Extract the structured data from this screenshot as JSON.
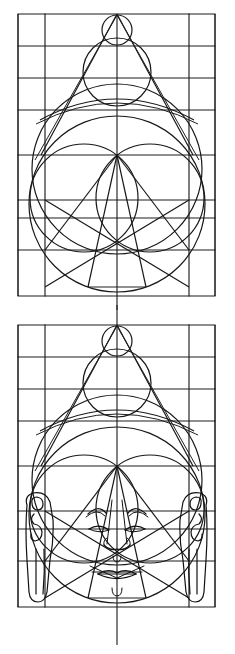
{
  "document": {
    "kind": "iconometric-construction-drawing",
    "subject": "Buddha head proportion grid",
    "figure_count": 2,
    "line_color": "#161616",
    "background_color": "#ffffff",
    "page_width": 235,
    "page_height": 654
  },
  "figures": [
    {
      "id": "figure-top",
      "label": "Geometric construction grid of the head",
      "frame": {
        "x": 18,
        "y": 14,
        "width": 197,
        "height": 282
      },
      "center_axis_x": 117,
      "vertical_grid_x": [
        18,
        45,
        117,
        189,
        215
      ],
      "horizontal_grid_y": [
        14,
        46,
        78,
        110,
        155,
        200,
        218,
        250,
        296
      ],
      "has_face_details": false,
      "has_ears": false
    },
    {
      "id": "figure-bottom",
      "label": "Same construction with facial features and elongated ears",
      "frame": {
        "x": 18,
        "y": 325,
        "width": 197,
        "height": 282
      },
      "center_axis_x": 117,
      "vertical_grid_x": [
        18,
        45,
        117,
        189,
        215
      ],
      "horizontal_grid_y": [
        325,
        357,
        389,
        421,
        466,
        511,
        529,
        561,
        607
      ],
      "has_face_details": true,
      "has_ears": true
    }
  ],
  "geometry": {
    "head_circle": {
      "cx": 117,
      "cy": 169,
      "r": 85
    },
    "cranium_arc_label": "upper skull arc",
    "ushnisha_large_circle": {
      "cx": 117,
      "cy": 70,
      "r": 33
    },
    "ushnisha_small_circle": {
      "cx": 117,
      "cy": 28,
      "r": 14
    },
    "cheek_circle_left": {
      "cx": 84,
      "cy": 182,
      "r": 45
    },
    "cheek_circle_right": {
      "cx": 150,
      "cy": 182,
      "r": 45
    },
    "apex_point": {
      "x": 117,
      "y": 14
    },
    "triangle_base_y": 155,
    "star_lines": "crossed diagonals forming star from apex and cheek centers"
  },
  "face_features": {
    "eyebrows": "two arcs above the eyes",
    "eyes": "two elongated almond arcs",
    "nose": "vertical bridge with flared nostrils and rounded tip",
    "mouth": "bow-shaped lips with central cleft",
    "chin": "small arc below the mouth",
    "urna_marker": "small circle on the center axis"
  },
  "ears": {
    "left": {
      "label": "left elongated ear",
      "x": 22,
      "y": 495,
      "width": 36,
      "height": 110
    },
    "right": {
      "label": "right elongated ear",
      "x": 177,
      "y": 495,
      "width": 36,
      "height": 110
    }
  }
}
